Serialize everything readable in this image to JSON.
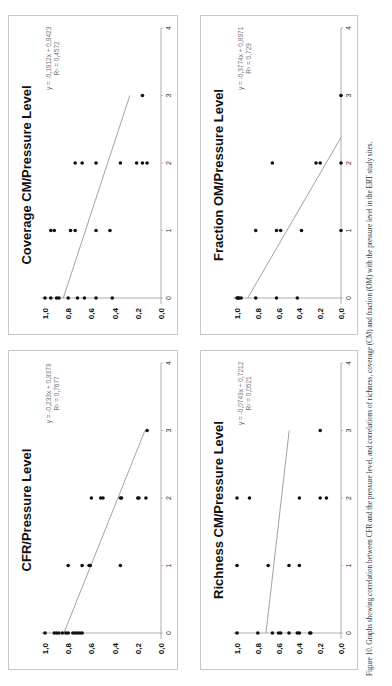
{
  "chart_data": [
    {
      "type": "scatter",
      "id": "cfr",
      "title": "CFR/Pressure Level",
      "xlabel": "",
      "ylabel": "",
      "xlim": [
        0,
        4
      ],
      "ylim": [
        0,
        1.0
      ],
      "x_ticks": [
        "0",
        "1",
        "2",
        "3",
        "4"
      ],
      "y_ticks": [
        "0,0",
        "0,2",
        "0,4",
        "0,6",
        "0,8",
        "1,0"
      ],
      "grid": false,
      "trendline": {
        "equation": "y = -0,233x + 0,8373",
        "r2": "R² = 0,7677",
        "slope": -0.233,
        "intercept": 0.8373,
        "x_range": [
          0,
          3
        ]
      },
      "points": [
        [
          0,
          1.0
        ],
        [
          0,
          0.92
        ],
        [
          0,
          0.9
        ],
        [
          0,
          0.88
        ],
        [
          0,
          0.85
        ],
        [
          0,
          0.82
        ],
        [
          0,
          0.8
        ],
        [
          0,
          0.76
        ],
        [
          0,
          0.74
        ],
        [
          0,
          0.72
        ],
        [
          0,
          0.7
        ],
        [
          0,
          0.68
        ],
        [
          1,
          0.8
        ],
        [
          1,
          0.68
        ],
        [
          1,
          0.62
        ],
        [
          1,
          0.61
        ],
        [
          1,
          0.35
        ],
        [
          2,
          0.6
        ],
        [
          2,
          0.52
        ],
        [
          2,
          0.5
        ],
        [
          2,
          0.35
        ],
        [
          2,
          0.34
        ],
        [
          2,
          0.2
        ],
        [
          2,
          0.19
        ],
        [
          2,
          0.13
        ],
        [
          3,
          0.12
        ]
      ]
    },
    {
      "type": "scatter",
      "id": "coverage_cm",
      "title": "Coverage CM/Pressure Level",
      "xlabel": "",
      "ylabel": "",
      "xlim": [
        0,
        4
      ],
      "ylim": [
        0,
        1.0
      ],
      "x_ticks": [
        "0",
        "1",
        "2",
        "3",
        "4"
      ],
      "y_ticks": [
        "0,0",
        "0,2",
        "0,4",
        "0,6",
        "0,8",
        "1,0"
      ],
      "grid": false,
      "trendline": {
        "equation": "y = -0,1912x + 0,8423",
        "r2": "R² = 0,4572",
        "slope": -0.1912,
        "intercept": 0.8423,
        "x_range": [
          0,
          3
        ]
      },
      "points": [
        [
          0,
          1.0
        ],
        [
          0,
          0.95
        ],
        [
          0,
          0.9
        ],
        [
          0,
          0.88
        ],
        [
          0,
          0.8
        ],
        [
          0,
          0.72
        ],
        [
          0,
          0.66
        ],
        [
          0,
          0.56
        ],
        [
          0,
          0.42
        ],
        [
          1,
          0.95
        ],
        [
          1,
          0.92
        ],
        [
          1,
          0.78
        ],
        [
          1,
          0.74
        ],
        [
          1,
          0.56
        ],
        [
          1,
          0.44
        ],
        [
          2,
          0.74
        ],
        [
          2,
          0.68
        ],
        [
          2,
          0.56
        ],
        [
          2,
          0.35
        ],
        [
          2,
          0.21
        ],
        [
          2,
          0.16
        ],
        [
          2,
          0.12
        ],
        [
          3,
          0.16
        ]
      ]
    },
    {
      "type": "scatter",
      "id": "richness_cm",
      "title": "Richness CM/Pressure Level",
      "xlabel": "",
      "ylabel": "",
      "xlim": [
        0,
        4
      ],
      "ylim": [
        0,
        1.0
      ],
      "x_ticks": [
        "0",
        "1",
        "2",
        "3",
        "4"
      ],
      "y_ticks": [
        "0,0",
        "0,2",
        "0,4",
        "0,6",
        "0,8",
        "1,0"
      ],
      "grid": false,
      "trendline": {
        "equation": "y = -0,0743x + 0,7212",
        "r2": "R² = 0,0521",
        "slope": -0.0743,
        "intercept": 0.7212,
        "x_range": [
          0,
          3
        ]
      },
      "points": [
        [
          0,
          1.0
        ],
        [
          0,
          0.8
        ],
        [
          0,
          0.66
        ],
        [
          0,
          0.6
        ],
        [
          0,
          0.58
        ],
        [
          0,
          0.5
        ],
        [
          0,
          0.42
        ],
        [
          0,
          0.4
        ],
        [
          0,
          0.3
        ],
        [
          0,
          0.29
        ],
        [
          1,
          1.0
        ],
        [
          1,
          0.7
        ],
        [
          1,
          0.5
        ],
        [
          1,
          0.4
        ],
        [
          2,
          1.0
        ],
        [
          2,
          0.88
        ],
        [
          2,
          0.4
        ],
        [
          2,
          0.2
        ],
        [
          2,
          0.14
        ],
        [
          3,
          0.2
        ]
      ]
    },
    {
      "type": "scatter",
      "id": "fraction_om",
      "title": "Fraction OM/Pressure Level",
      "xlabel": "",
      "ylabel": "",
      "xlim": [
        0,
        4
      ],
      "ylim": [
        0,
        1.0
      ],
      "x_ticks": [
        "0",
        "1",
        "2",
        "3",
        "4"
      ],
      "y_ticks": [
        "0,0",
        "0,2",
        "0,4",
        "0,6",
        "0,8",
        "1,0"
      ],
      "grid": false,
      "trendline": {
        "equation": "y = -0,3774x + 0,8971",
        "r2": "R² = 0,729",
        "slope": -0.3774,
        "intercept": 0.8971,
        "x_range": [
          0,
          2.38
        ]
      },
      "points": [
        [
          0,
          1.0
        ],
        [
          0,
          0.99
        ],
        [
          0,
          0.98
        ],
        [
          0,
          0.96
        ],
        [
          0,
          0.82
        ],
        [
          0,
          0.62
        ],
        [
          0,
          0.42
        ],
        [
          1,
          0.82
        ],
        [
          1,
          0.62
        ],
        [
          1,
          0.58
        ],
        [
          1,
          0.38
        ],
        [
          1,
          0.0
        ],
        [
          2,
          0.66
        ],
        [
          2,
          0.24
        ],
        [
          2,
          0.2
        ],
        [
          2,
          0.0
        ],
        [
          3,
          0.0
        ]
      ]
    }
  ],
  "figure": {
    "caption": "Figure 10. Graphs showing correlation between CFR and the pressure level, and correlations of richness, coverage (CM) and fraction (OM) with the pressure level in the ERT study sites."
  }
}
